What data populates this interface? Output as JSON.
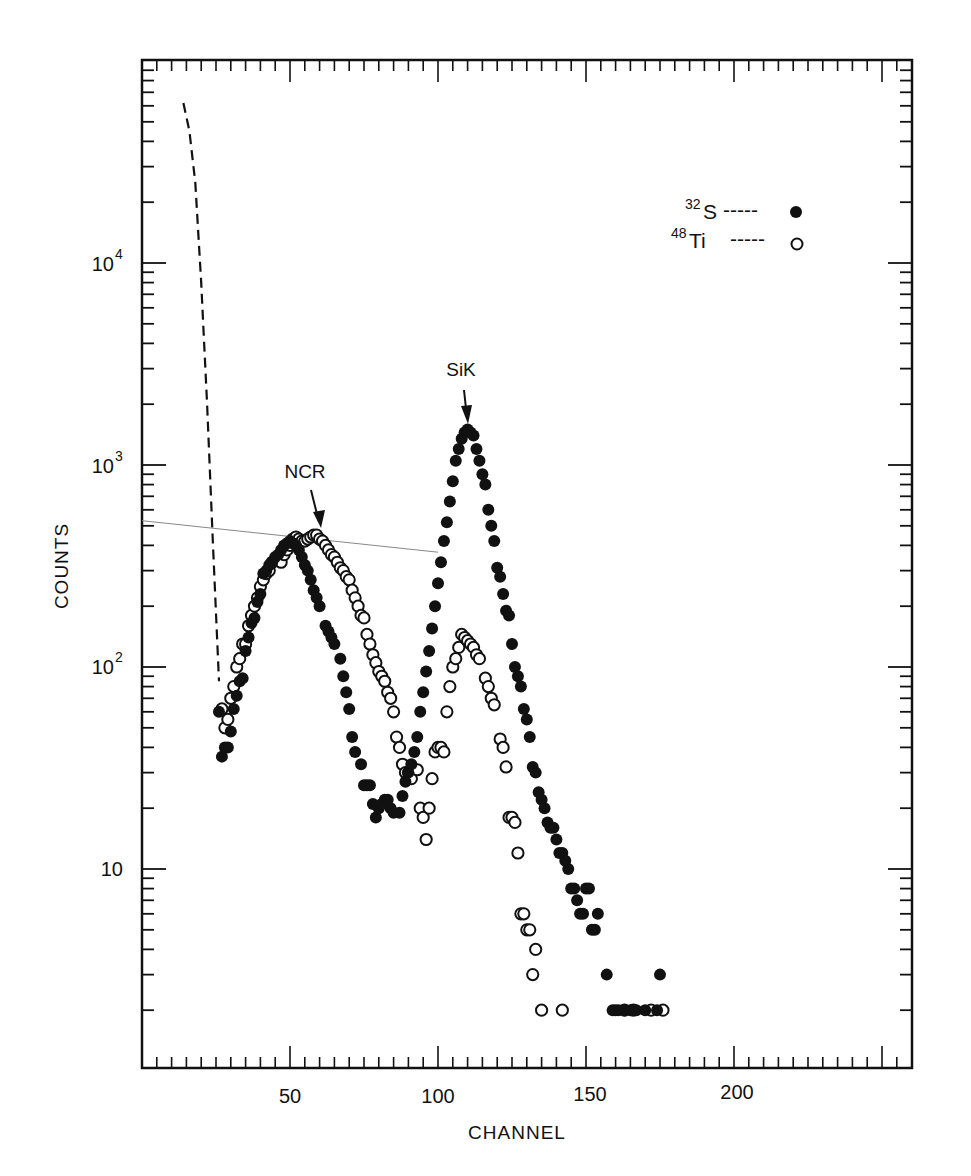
{
  "chart_data": {
    "type": "scatter",
    "title": "",
    "xlabel": "CHANNEL",
    "ylabel": "COUNTS",
    "xscale": "linear",
    "yscale": "log",
    "xlim": [
      0,
      262
    ],
    "ylim": [
      1,
      100000
    ],
    "grid": false,
    "legend_position": "upper right",
    "x_ticks": [
      50,
      100,
      150,
      200
    ],
    "x_tick_labels": [
      "50",
      "100",
      "150",
      "200"
    ],
    "y_ticks": [
      10,
      100,
      1000,
      10000
    ],
    "y_tick_labels": [
      "10",
      "10^2",
      "10^3",
      "10^4"
    ],
    "annotations": [
      {
        "text": "NCR",
        "x": 59,
        "y": 450,
        "arrow": true
      },
      {
        "text": "SiK",
        "x": 109,
        "y": 1450,
        "arrow": true
      }
    ],
    "series": [
      {
        "name": "32S",
        "marker": "filled-circle",
        "points": [
          [
            26,
            60
          ],
          [
            27,
            36
          ],
          [
            28,
            40
          ],
          [
            29,
            40
          ],
          [
            30,
            48
          ],
          [
            31,
            62
          ],
          [
            32,
            72
          ],
          [
            33,
            85
          ],
          [
            34,
            88
          ],
          [
            35,
            120
          ],
          [
            36,
            140
          ],
          [
            37,
            165
          ],
          [
            38,
            175
          ],
          [
            39,
            210
          ],
          [
            40,
            230
          ],
          [
            41,
            290
          ],
          [
            42,
            300
          ],
          [
            43,
            320
          ],
          [
            44,
            330
          ],
          [
            45,
            350
          ],
          [
            46,
            360
          ],
          [
            47,
            380
          ],
          [
            48,
            400
          ],
          [
            49,
            410
          ],
          [
            50,
            420
          ],
          [
            51,
            410
          ],
          [
            52,
            400
          ],
          [
            53,
            380
          ],
          [
            54,
            350
          ],
          [
            55,
            320
          ],
          [
            56,
            300
          ],
          [
            57,
            270
          ],
          [
            58,
            240
          ],
          [
            59,
            220
          ],
          [
            60,
            200
          ],
          [
            62,
            160
          ],
          [
            63,
            150
          ],
          [
            64,
            140
          ],
          [
            65,
            130
          ],
          [
            67,
            110
          ],
          [
            68,
            90
          ],
          [
            69,
            75
          ],
          [
            70,
            62
          ],
          [
            71,
            45
          ],
          [
            72,
            38
          ],
          [
            74,
            33
          ],
          [
            75,
            26
          ],
          [
            76,
            26
          ],
          [
            77,
            26
          ],
          [
            78,
            21
          ],
          [
            79,
            18
          ],
          [
            80,
            20
          ],
          [
            81,
            21
          ],
          [
            82,
            22
          ],
          [
            83,
            22
          ],
          [
            84,
            20
          ],
          [
            85,
            19
          ],
          [
            87,
            19
          ],
          [
            88,
            23
          ],
          [
            89,
            27
          ],
          [
            90,
            30
          ],
          [
            91,
            33
          ],
          [
            92,
            38
          ],
          [
            93,
            45
          ],
          [
            94,
            60
          ],
          [
            95,
            75
          ],
          [
            96,
            95
          ],
          [
            97,
            120
          ],
          [
            98,
            155
          ],
          [
            99,
            200
          ],
          [
            100,
            260
          ],
          [
            101,
            330
          ],
          [
            102,
            420
          ],
          [
            103,
            520
          ],
          [
            104,
            660
          ],
          [
            105,
            830
          ],
          [
            106,
            1050
          ],
          [
            107,
            1200
          ],
          [
            108,
            1350
          ],
          [
            109,
            1450
          ],
          [
            110,
            1500
          ],
          [
            111,
            1450
          ],
          [
            112,
            1400
          ],
          [
            113,
            1200
          ],
          [
            114,
            1050
          ],
          [
            115,
            900
          ],
          [
            116,
            800
          ],
          [
            117,
            600
          ],
          [
            118,
            500
          ],
          [
            119,
            420
          ],
          [
            120,
            310
          ],
          [
            121,
            280
          ],
          [
            122,
            230
          ],
          [
            123,
            190
          ],
          [
            124,
            180
          ],
          [
            125,
            130
          ],
          [
            126,
            100
          ],
          [
            127,
            90
          ],
          [
            128,
            80
          ],
          [
            129,
            62
          ],
          [
            130,
            55
          ],
          [
            131,
            45
          ],
          [
            132,
            32
          ],
          [
            133,
            30
          ],
          [
            134,
            24
          ],
          [
            135,
            22
          ],
          [
            136,
            20
          ],
          [
            137,
            17
          ],
          [
            138,
            16
          ],
          [
            139,
            16
          ],
          [
            140,
            14
          ],
          [
            141,
            12
          ],
          [
            142,
            12
          ],
          [
            143,
            11
          ],
          [
            144,
            10
          ],
          [
            145,
            8
          ],
          [
            146,
            8
          ],
          [
            147,
            7
          ],
          [
            148,
            6
          ],
          [
            149,
            6
          ],
          [
            150,
            8
          ],
          [
            151,
            8
          ],
          [
            152,
            5
          ],
          [
            153,
            5
          ],
          [
            154,
            6
          ],
          [
            157,
            3
          ],
          [
            159,
            2
          ],
          [
            160,
            2
          ],
          [
            161,
            2
          ],
          [
            163,
            2
          ],
          [
            165,
            2
          ],
          [
            167,
            2
          ],
          [
            170,
            2
          ],
          [
            175,
            3
          ],
          [
            174,
            2
          ]
        ]
      },
      {
        "name": "48Ti",
        "marker": "open-circle",
        "points": [
          [
            27,
            62
          ],
          [
            28,
            50
          ],
          [
            29,
            55
          ],
          [
            30,
            70
          ],
          [
            31,
            80
          ],
          [
            32,
            100
          ],
          [
            33,
            110
          ],
          [
            34,
            130
          ],
          [
            35,
            130
          ],
          [
            36,
            160
          ],
          [
            37,
            180
          ],
          [
            38,
            200
          ],
          [
            39,
            220
          ],
          [
            40,
            250
          ],
          [
            41,
            270
          ],
          [
            42,
            290
          ],
          [
            43,
            300
          ],
          [
            44,
            330
          ],
          [
            45,
            340
          ],
          [
            46,
            350
          ],
          [
            47,
            330
          ],
          [
            48,
            360
          ],
          [
            49,
            380
          ],
          [
            50,
            400
          ],
          [
            51,
            430
          ],
          [
            52,
            440
          ],
          [
            53,
            430
          ],
          [
            54,
            420
          ],
          [
            55,
            420
          ],
          [
            56,
            430
          ],
          [
            57,
            440
          ],
          [
            58,
            450
          ],
          [
            59,
            450
          ],
          [
            60,
            430
          ],
          [
            61,
            420
          ],
          [
            62,
            400
          ],
          [
            63,
            380
          ],
          [
            64,
            360
          ],
          [
            65,
            350
          ],
          [
            66,
            330
          ],
          [
            67,
            310
          ],
          [
            68,
            300
          ],
          [
            69,
            280
          ],
          [
            70,
            270
          ],
          [
            71,
            240
          ],
          [
            72,
            220
          ],
          [
            73,
            200
          ],
          [
            74,
            180
          ],
          [
            75,
            175
          ],
          [
            76,
            145
          ],
          [
            77,
            130
          ],
          [
            78,
            115
          ],
          [
            79,
            105
          ],
          [
            80,
            95
          ],
          [
            81,
            90
          ],
          [
            82,
            85
          ],
          [
            83,
            75
          ],
          [
            84,
            70
          ],
          [
            85,
            60
          ],
          [
            86,
            45
          ],
          [
            87,
            40
          ],
          [
            88,
            33
          ],
          [
            89,
            30
          ],
          [
            90,
            30
          ],
          [
            91,
            28
          ],
          [
            93,
            31
          ],
          [
            94,
            20
          ],
          [
            95,
            18
          ],
          [
            96,
            14
          ],
          [
            97,
            20
          ],
          [
            98,
            28
          ],
          [
            99,
            38
          ],
          [
            100,
            40
          ],
          [
            101,
            40
          ],
          [
            102,
            38
          ],
          [
            103,
            60
          ],
          [
            104,
            80
          ],
          [
            105,
            100
          ],
          [
            106,
            110
          ],
          [
            107,
            125
          ],
          [
            108,
            145
          ],
          [
            109,
            140
          ],
          [
            110,
            135
          ],
          [
            111,
            130
          ],
          [
            112,
            125
          ],
          [
            113,
            115
          ],
          [
            114,
            110
          ],
          [
            116,
            88
          ],
          [
            117,
            80
          ],
          [
            118,
            70
          ],
          [
            119,
            65
          ],
          [
            121,
            44
          ],
          [
            122,
            40
          ],
          [
            123,
            32
          ],
          [
            124,
            18
          ],
          [
            125,
            18
          ],
          [
            126,
            17
          ],
          [
            127,
            12
          ],
          [
            128,
            6
          ],
          [
            129,
            6
          ],
          [
            130,
            5
          ],
          [
            131,
            5
          ],
          [
            132,
            3
          ],
          [
            133,
            4
          ],
          [
            135,
            2
          ],
          [
            142,
            2
          ],
          [
            163,
            2
          ],
          [
            166,
            2
          ],
          [
            172,
            2
          ],
          [
            176,
            2
          ]
        ]
      }
    ],
    "extra_lines": [
      {
        "name": "dashed-background-curve",
        "style": "dashed",
        "points": [
          [
            14,
            62000
          ],
          [
            16,
            45000
          ],
          [
            18,
            25000
          ],
          [
            20,
            8000
          ],
          [
            22,
            2000
          ],
          [
            24,
            400
          ],
          [
            26,
            85
          ]
        ]
      },
      {
        "name": "faint-guide-line",
        "style": "thin-solid",
        "points": [
          [
            0,
            530
          ],
          [
            100,
            370
          ]
        ]
      }
    ]
  },
  "axes": {
    "x_label": "CHANNEL",
    "y_label": "COUNTS",
    "x_tick_labels": [
      "50",
      "100",
      "150",
      "200"
    ],
    "y_tick_labels": [
      {
        "base": "10",
        "exp": "4"
      },
      {
        "base": "10",
        "exp": "3"
      },
      {
        "base": "10",
        "exp": "2"
      },
      {
        "base": "10",
        "exp": ""
      }
    ]
  },
  "annotations": {
    "ncr": "NCR",
    "sik": "SiK"
  },
  "legend": {
    "items": [
      {
        "mass": "32",
        "element": "S",
        "dashes": "-----",
        "marker": "filled"
      },
      {
        "mass": "48",
        "element": "Ti",
        "dashes": "-----",
        "marker": "open"
      }
    ]
  },
  "colors": {
    "ink": "#111111",
    "background": "#ffffff",
    "faint_line": "#888888"
  }
}
